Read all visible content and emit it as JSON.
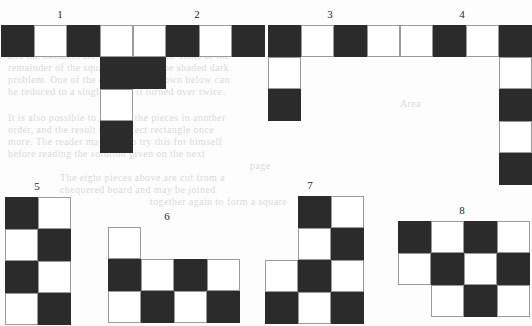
{
  "page": {
    "background_color": "#fdfdfd",
    "dark_cell_color": "#2b2b2b",
    "light_cell_color": "#ffffff",
    "cell_border_color": "#9a9a9a",
    "cell_width_px": 33,
    "cell_height_px": 32
  },
  "ghost_text": [
    {
      "text": "and the numbers are placed so that the sums of the",
      "x": 8,
      "y": 50
    },
    {
      "text": "remainder of the squares must also be shaded dark",
      "x": 8,
      "y": 62
    },
    {
      "text": "problem. One of the eight pieces shown below can",
      "x": 8,
      "y": 74
    },
    {
      "text": "be reduced to a single figure if turned over twice.",
      "x": 8,
      "y": 86
    },
    {
      "text": "Area",
      "x": 400,
      "y": 98
    },
    {
      "text": "It is also possible to arrange the pieces in another",
      "x": 8,
      "y": 112
    },
    {
      "text": "order, and the result is a perfect rectangle once",
      "x": 8,
      "y": 124
    },
    {
      "text": "more. The reader may care to try this for himself",
      "x": 8,
      "y": 136
    },
    {
      "text": "before reading the solution given on the next",
      "x": 8,
      "y": 148
    },
    {
      "text": "page",
      "x": 250,
      "y": 160
    },
    {
      "text": "The eight pieces above are cut from a",
      "x": 60,
      "y": 172
    },
    {
      "text": "chequered board and may be joined",
      "x": 60,
      "y": 184
    },
    {
      "text": "together again to form a square",
      "x": 150,
      "y": 196
    }
  ],
  "figures": [
    {
      "id": "figure-1",
      "label": "1",
      "label_x": 50,
      "label_y": 8,
      "grid_x": 1,
      "grid_y": 25,
      "columns": 4,
      "rows": 4,
      "cells": [
        "dark",
        "light",
        "dark",
        "light",
        "empty",
        "empty",
        "empty",
        "dark",
        "empty",
        "empty",
        "empty",
        "light",
        "empty",
        "empty",
        "empty",
        "dark"
      ]
    },
    {
      "id": "figure-2",
      "label": "2",
      "label_x": 187,
      "label_y": 8,
      "grid_x": 133,
      "grid_y": 25,
      "columns": 4,
      "rows": 2,
      "cells": [
        "light",
        "dark",
        "light",
        "dark",
        "dark",
        "empty",
        "empty",
        "empty"
      ]
    },
    {
      "id": "figure-3",
      "label": "3",
      "label_x": 320,
      "label_y": 8,
      "grid_x": 268,
      "grid_y": 25,
      "columns": 4,
      "rows": 3,
      "cells": [
        "dark",
        "light",
        "dark",
        "light",
        "light",
        "empty",
        "empty",
        "empty",
        "dark",
        "empty",
        "empty",
        "empty"
      ]
    },
    {
      "id": "figure-4",
      "label": "4",
      "label_x": 452,
      "label_y": 8,
      "grid_x": 400,
      "grid_y": 25,
      "columns": 4,
      "rows": 5,
      "cells": [
        "light",
        "dark",
        "light",
        "dark",
        "empty",
        "empty",
        "empty",
        "light",
        "empty",
        "empty",
        "empty",
        "dark",
        "empty",
        "empty",
        "empty",
        "light",
        "empty",
        "empty",
        "empty",
        "dark"
      ]
    },
    {
      "id": "figure-5",
      "label": "5",
      "label_x": 27,
      "label_y": 180,
      "grid_x": 5,
      "grid_y": 197,
      "columns": 2,
      "rows": 4,
      "cells": [
        "dark",
        "light",
        "light",
        "dark",
        "dark",
        "light",
        "light",
        "dark"
      ]
    },
    {
      "id": "figure-6",
      "label": "6",
      "label_x": 157,
      "label_y": 210,
      "grid_x": 108,
      "grid_y": 227,
      "columns": 4,
      "rows": 3,
      "cells": [
        "light",
        "empty",
        "empty",
        "empty",
        "dark",
        "light",
        "dark",
        "light",
        "light",
        "dark",
        "light",
        "dark"
      ]
    },
    {
      "id": "figure-7",
      "label": "7",
      "label_x": 300,
      "label_y": 179,
      "grid_x": 265,
      "grid_y": 196,
      "columns": 3,
      "rows": 4,
      "cells": [
        "empty",
        "dark",
        "light",
        "empty",
        "light",
        "dark",
        "light",
        "dark",
        "light",
        "dark",
        "light",
        "dark"
      ]
    },
    {
      "id": "figure-8",
      "label": "8",
      "label_x": 452,
      "label_y": 204,
      "grid_x": 398,
      "grid_y": 221,
      "columns": 4,
      "rows": 3,
      "cells": [
        "dark",
        "light",
        "dark",
        "light",
        "light",
        "dark",
        "light",
        "dark",
        "empty",
        "light",
        "dark",
        "light"
      ]
    }
  ]
}
